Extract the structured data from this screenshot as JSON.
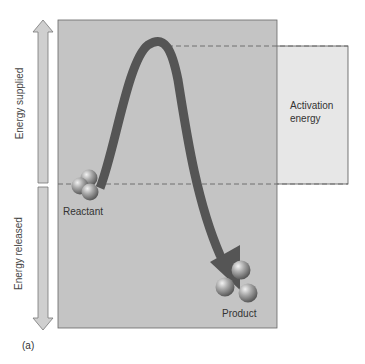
{
  "diagram": {
    "panel_label": "(a)",
    "axis": {
      "up_label": "Energy supplied",
      "down_label": "Energy released"
    },
    "activation_box_label": "Activation energy",
    "activation_line1": "Activation",
    "activation_line2": "energy",
    "reactant_label": "Reactant",
    "product_label": "Product",
    "colors": {
      "panel": "#c4c4c4",
      "activation_box": "#e6e6e6",
      "curve": "#555555",
      "arrow_fill": "#c9c9c9",
      "dashed": "#666666"
    }
  }
}
